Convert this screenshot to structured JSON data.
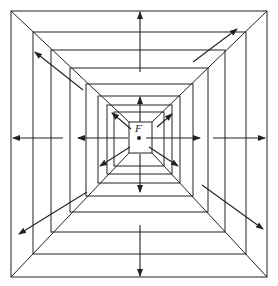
{
  "diagram": {
    "type": "nested-squares-radiating-arrows",
    "center_label": "F",
    "stroke_color": "#222222",
    "background": "#ffffff",
    "outer": [
      11,
      11,
      267,
      277
    ],
    "inner_rect": [
      129,
      122,
      152,
      153
    ],
    "center": [
      139,
      138
    ],
    "squares": [
      [
        11,
        11,
        267,
        277
      ],
      [
        33,
        32,
        246,
        254
      ],
      [
        51,
        50,
        225,
        232
      ],
      [
        70,
        68,
        208,
        212
      ],
      [
        86,
        84,
        193,
        196
      ],
      [
        98,
        96,
        180,
        183
      ],
      [
        107,
        105,
        172,
        174
      ],
      [
        114,
        112,
        164,
        166
      ]
    ],
    "arrows": [
      {
        "from": [
          63,
          138
        ],
        "to": [
          13,
          138
        ]
      },
      {
        "from": [
          128,
          138
        ],
        "to": [
          78,
          138
        ]
      },
      {
        "from": [
          146,
          138
        ],
        "to": [
          200,
          138
        ]
      },
      {
        "from": [
          213,
          138
        ],
        "to": [
          265,
          138
        ]
      },
      {
        "from": [
          140,
          72
        ],
        "to": [
          140,
          12
        ]
      },
      {
        "from": [
          140,
          122
        ],
        "to": [
          140,
          97
        ]
      },
      {
        "from": [
          140,
          154
        ],
        "to": [
          140,
          192
        ]
      },
      {
        "from": [
          140,
          225
        ],
        "to": [
          140,
          276
        ]
      },
      {
        "from": [
          83,
          90
        ],
        "to": [
          35,
          52
        ]
      },
      {
        "from": [
          131,
          129
        ],
        "to": [
          112,
          113
        ]
      },
      {
        "from": [
          193,
          62
        ],
        "to": [
          237,
          29
        ]
      },
      {
        "from": [
          157,
          127
        ],
        "to": [
          172,
          114
        ]
      },
      {
        "from": [
          87,
          192
        ],
        "to": [
          19,
          234
        ]
      },
      {
        "from": [
          130,
          147
        ],
        "to": [
          100,
          166
        ]
      },
      {
        "from": [
          202,
          185
        ],
        "to": [
          263,
          229
        ]
      },
      {
        "from": [
          149,
          147
        ],
        "to": [
          178,
          166
        ]
      }
    ]
  }
}
